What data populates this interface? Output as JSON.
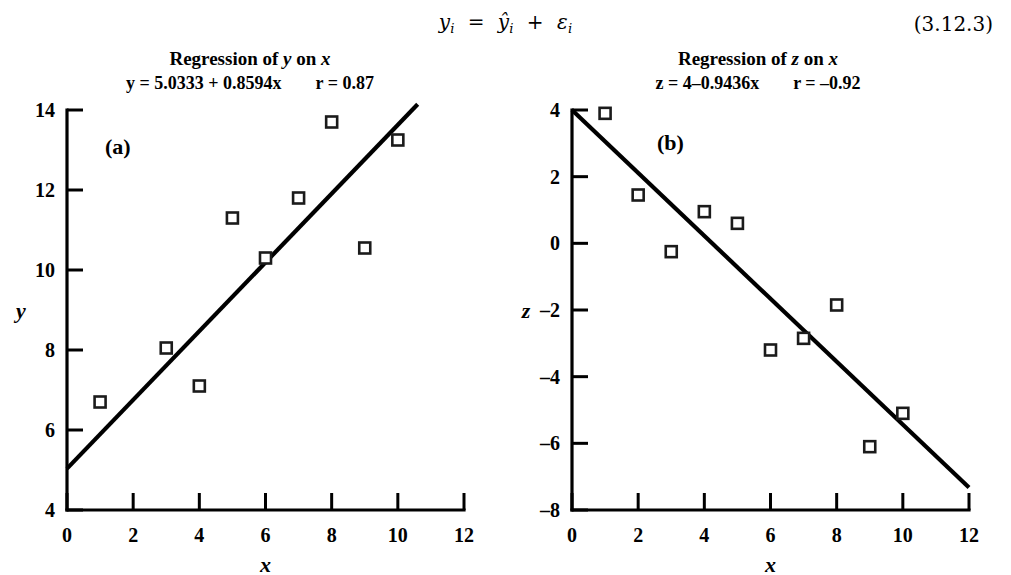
{
  "equation": {
    "text": "y_i = ŷ_i + ε_i",
    "number": "(3.12.3)"
  },
  "panels": [
    {
      "letter": "(a)",
      "title_prefix": "Regression of ",
      "title_var": "y",
      "title_suffix": " on ",
      "title_var2": "x",
      "fit_equation": "y = 5.0333 + 0.8594x",
      "correlation": "r = 0.87",
      "chart_data": {
        "type": "scatter",
        "title": "Regression of y on x",
        "annotation": "(a)",
        "xlabel": "x",
        "ylabel": "y",
        "xlim": [
          0,
          12
        ],
        "ylim": [
          4,
          14
        ],
        "xticks": [
          "0",
          "2",
          "4",
          "6",
          "8",
          "10",
          "12"
        ],
        "xtick_values": [
          0,
          2,
          4,
          6,
          8,
          10,
          12
        ],
        "yticks": [
          "4",
          "6",
          "8",
          "10",
          "12",
          "14"
        ],
        "ytick_values": [
          4,
          6,
          8,
          10,
          12,
          14
        ],
        "grid": false,
        "legend": "none",
        "x": [
          1,
          3,
          4,
          5,
          6,
          7,
          8,
          9,
          10,
          10
        ],
        "y": [
          6.7,
          8.05,
          7.1,
          11.3,
          10.3,
          11.8,
          13.7,
          10.55,
          13.25,
          13.25
        ],
        "points": [
          {
            "x": 1,
            "y": 6.7
          },
          {
            "x": 3,
            "y": 8.05
          },
          {
            "x": 4,
            "y": 7.1
          },
          {
            "x": 5,
            "y": 11.3
          },
          {
            "x": 6,
            "y": 10.3
          },
          {
            "x": 7,
            "y": 11.8
          },
          {
            "x": 8,
            "y": 13.7
          },
          {
            "x": 9,
            "y": 10.55
          },
          {
            "x": 10,
            "y": 13.25
          }
        ],
        "fit": {
          "label": "y = 5.0333 + 0.8594x",
          "intercept": 5.0333,
          "slope": 0.8594,
          "r": 0.87,
          "r_label": "r = 0.87",
          "x_start": 0,
          "x_end": 10.6
        }
      }
    },
    {
      "letter": "(b)",
      "title_prefix": "Regression of ",
      "title_var": "z",
      "title_suffix": " on ",
      "title_var2": "x",
      "fit_equation": "z = 4–0.9436x",
      "correlation": "r = –0.92",
      "chart_data": {
        "type": "scatter",
        "title": "Regression of z on x",
        "annotation": "(b)",
        "xlabel": "x",
        "ylabel": "z",
        "xlim": [
          0,
          12
        ],
        "ylim": [
          -8,
          4
        ],
        "xticks": [
          "0",
          "2",
          "4",
          "6",
          "8",
          "10",
          "12"
        ],
        "xtick_values": [
          0,
          2,
          4,
          6,
          8,
          10,
          12
        ],
        "yticks": [
          "4",
          "2",
          "0",
          "–2",
          "–4",
          "–6",
          "–8"
        ],
        "ytick_values": [
          4,
          2,
          0,
          -2,
          -4,
          -6,
          -8
        ],
        "grid": false,
        "legend": "none",
        "x": [
          1,
          2,
          3,
          4,
          5,
          6,
          7,
          8,
          9,
          10
        ],
        "y": [
          3.9,
          1.45,
          -0.25,
          0.95,
          0.6,
          -3.2,
          -2.85,
          -1.85,
          -6.1,
          -5.1
        ],
        "points": [
          {
            "x": 1,
            "y": 3.9
          },
          {
            "x": 2,
            "y": 1.45
          },
          {
            "x": 3,
            "y": -0.25
          },
          {
            "x": 4,
            "y": 0.95
          },
          {
            "x": 5,
            "y": 0.6
          },
          {
            "x": 6,
            "y": -3.2
          },
          {
            "x": 7,
            "y": -2.85
          },
          {
            "x": 8,
            "y": -1.85
          },
          {
            "x": 9,
            "y": -6.1
          },
          {
            "x": 10,
            "y": -5.1
          }
        ],
        "fit": {
          "label": "z = 4–0.9436x",
          "intercept": 4,
          "slope": -0.9436,
          "r": -0.92,
          "r_label": "r = –0.92",
          "x_start": 0,
          "x_end": 12
        }
      }
    }
  ]
}
